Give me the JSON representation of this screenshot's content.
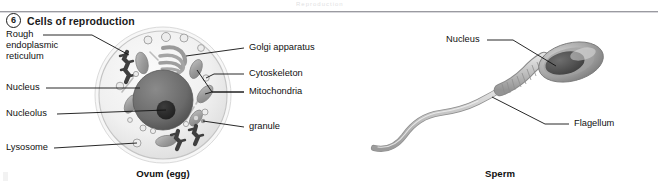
{
  "page": {
    "running_head": "Reproduction",
    "heading_number": "6",
    "heading_text": "Cells of reproduction"
  },
  "ovum": {
    "caption": "Ovum (egg)",
    "labels_left": [
      {
        "id": "rough-er",
        "text": "Rough\nendoplasmic\nreticulum"
      },
      {
        "id": "nucleus",
        "text": "Nucleus"
      },
      {
        "id": "nucleolus",
        "text": "Nucleolus"
      },
      {
        "id": "lysosome",
        "text": "Lysosome"
      }
    ],
    "labels_right": [
      {
        "id": "golgi",
        "text": "Golgi apparatus"
      },
      {
        "id": "cytoskeleton",
        "text": "Cytoskeleton"
      },
      {
        "id": "mitochondria",
        "text": "Mitochondria"
      },
      {
        "id": "granule",
        "text": "granule"
      }
    ]
  },
  "sperm": {
    "caption": "Sperm",
    "labels": [
      {
        "id": "nucleus",
        "text": "Nucleus"
      },
      {
        "id": "flagellum",
        "text": "Flagellum"
      }
    ]
  },
  "colors": {
    "ink": "#111111",
    "cytoplasm": "#f2f2f2",
    "membrane": "#c9c9c9",
    "nucleus": "#6f6f6f",
    "nucleolus": "#2e2e2e",
    "organelle": "#a8a8a8",
    "organelle_dark": "#8d8d8d",
    "rough_er": "#4a4a4a",
    "sperm_head": "#8e8e8e",
    "sperm_nucleus": "#555555",
    "tail": "#bdbdbd"
  }
}
